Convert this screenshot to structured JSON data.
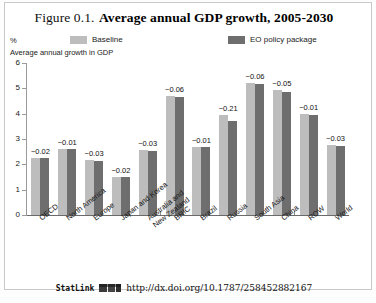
{
  "figure": {
    "title_prefix": "Figure 0.1.",
    "title_main": "Average annual GDP growth, 2005-2030",
    "unit_label": "%",
    "subtitle": "Average annual growth in GDP"
  },
  "legend": {
    "position": "top",
    "items": [
      {
        "label": "Baseline",
        "color": "#bdbdbd",
        "name": "legend-baseline"
      },
      {
        "label": "EO policy package",
        "color": "#6e6e6e",
        "name": "legend-policy"
      }
    ]
  },
  "statlink": {
    "word": "StatLink",
    "url": "http://dx.doi.org/10.1787/258452882167"
  },
  "chart_data": {
    "type": "bar",
    "title": "Average annual GDP growth, 2005-2030",
    "subtitle": "Average annual growth in GDP",
    "xlabel": "",
    "ylabel": "%",
    "ylim": [
      0,
      6
    ],
    "yticks": [
      0,
      1,
      2,
      3,
      4,
      5,
      6
    ],
    "grid": false,
    "legend_position": "top",
    "categories": [
      "OECD",
      "North America",
      "Europe",
      "Japan and Korea",
      "Australia and\nNew Zealand",
      "BRIC",
      "Brazil",
      "Russia",
      "South Asia",
      "China",
      "ROW",
      "World"
    ],
    "series": [
      {
        "name": "Baseline",
        "color": "#bdbdbd",
        "values": [
          2.26,
          2.6,
          2.18,
          1.51,
          2.56,
          4.7,
          2.7,
          3.93,
          5.23,
          4.92,
          3.97,
          2.76
        ]
      },
      {
        "name": "EO policy package",
        "color": "#6e6e6e",
        "values": [
          2.24,
          2.59,
          2.15,
          1.49,
          2.53,
          4.64,
          2.69,
          3.72,
          5.17,
          4.87,
          3.96,
          2.73
        ]
      }
    ],
    "difference_labels": [
      "−0.02",
      "−0.01",
      "−0.03",
      "−0.02",
      "−0.03",
      "−0.06",
      "−0.01",
      "−0.21",
      "−0.06",
      "−0.05",
      "−0.01",
      "−0.03"
    ],
    "group_separators_after": [
      "Australia and\nNew Zealand",
      "China"
    ]
  }
}
